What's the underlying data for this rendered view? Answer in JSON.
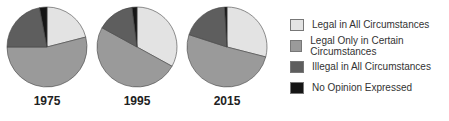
{
  "chart_data": {
    "type": "pie",
    "title": "",
    "legend_position": "right",
    "categories": [
      "Legal in All Circumstances",
      "Legal Only in Certain Circumstances",
      "Illegal in All Circumstances",
      "No Opinion Expressed"
    ],
    "colors": [
      "#e3e3e3",
      "#9a9a9a",
      "#5e5e5e",
      "#151515"
    ],
    "series": [
      {
        "name": "1975",
        "values": [
          21,
          54,
          22,
          3
        ]
      },
      {
        "name": "1995",
        "values": [
          33,
          50,
          15,
          2
        ]
      },
      {
        "name": "2015",
        "values": [
          29,
          51,
          19,
          1
        ]
      }
    ]
  },
  "pies": [
    {
      "label": "1975"
    },
    {
      "label": "1995"
    },
    {
      "label": "2015"
    }
  ],
  "legend": [
    {
      "label": "Legal in All Circumstances"
    },
    {
      "label": "Legal Only in Certain Circumstances"
    },
    {
      "label": "Illegal in All Circumstances"
    },
    {
      "label": "No Opinion Expressed"
    }
  ]
}
